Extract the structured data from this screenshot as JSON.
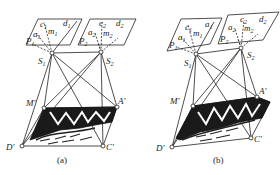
{
  "figure": {
    "panels": [
      {
        "id": "a",
        "caption": "(a)",
        "photo1": {
          "corners": [
            [
              38,
              19
            ],
            [
              82,
              19
            ],
            [
              70,
              45
            ],
            [
              26,
              45
            ]
          ],
          "labels": {
            "c": "c1",
            "d": "d1",
            "a": "a1",
            "m": "m1",
            "p": "P1"
          }
        },
        "photo2": {
          "corners": [
            [
              90,
              19
            ],
            [
              136,
              19
            ],
            [
              124,
              45
            ],
            [
              78,
              45
            ]
          ],
          "labels": {
            "c": "c2",
            "d": "d2",
            "a": "a2",
            "m": "m2",
            "p": "P2"
          }
        },
        "S1": {
          "label": "S1",
          "pos": [
            52,
            53
          ]
        },
        "S2": {
          "label": "S2",
          "pos": [
            101,
            52
          ]
        },
        "ground": {
          "M": {
            "label": "M'",
            "pos": [
              44,
              108
            ]
          },
          "A": {
            "label": "A'",
            "pos": [
              117,
              107
            ]
          },
          "D": {
            "label": "D'",
            "pos": [
              22,
              146
            ]
          },
          "C": {
            "label": "C'",
            "pos": [
              103,
              146
            ]
          }
        }
      },
      {
        "id": "b",
        "caption": "(b)",
        "photo1": {
          "corners": [
            [
              181,
              19
            ],
            [
              222,
              18
            ],
            [
              210,
              44
            ],
            [
              167,
              51
            ]
          ],
          "labels": {
            "c": "c1",
            "d": "d1",
            "a": "a1",
            "m": "m1",
            "p": "P1"
          }
        },
        "photo2": {
          "corners": [
            [
              228,
              15
            ],
            [
              279,
              12
            ],
            [
              263,
              40
            ],
            [
              218,
              44
            ]
          ],
          "labels": {
            "c": "c2",
            "d": "d2",
            "a": "a2",
            "m": "m2",
            "p": "P2"
          }
        },
        "S1": {
          "label": "S1",
          "pos": [
            196,
            54
          ]
        },
        "S2": {
          "label": "S2",
          "pos": [
            241,
            48
          ]
        },
        "ground": {
          "M": {
            "label": "M'",
            "pos": [
              193,
              106
            ]
          },
          "A": {
            "label": "A'",
            "pos": [
              257,
              97
            ]
          },
          "D": {
            "label": "D'",
            "pos": [
              172,
              147
            ]
          },
          "C": {
            "label": "C'",
            "pos": [
              251,
              138
            ]
          }
        }
      }
    ],
    "labels": {
      "a_caption": "(a)",
      "b_caption": "(b)",
      "S1": "S",
      "S2": "S",
      "sub1": "1",
      "sub2": "2",
      "M": "M'",
      "A": "A'",
      "D": "D'",
      "C": "C'",
      "c": "c",
      "d": "d",
      "a": "a",
      "m": "m",
      "P": "P"
    }
  }
}
